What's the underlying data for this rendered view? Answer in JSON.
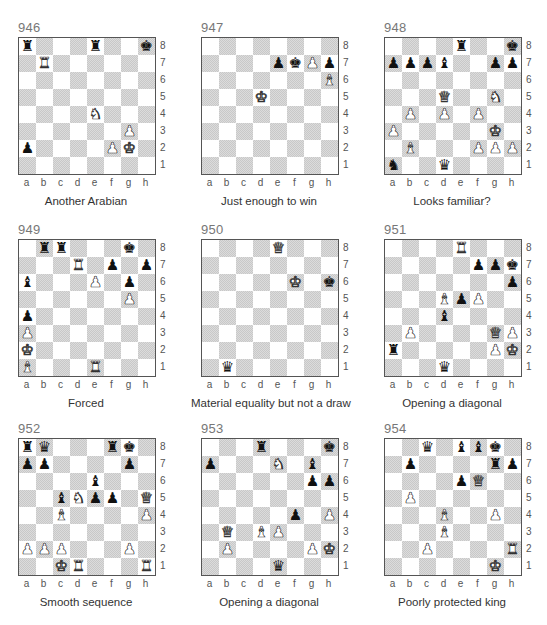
{
  "files": [
    "a",
    "b",
    "c",
    "d",
    "e",
    "f",
    "g",
    "h"
  ],
  "ranks": [
    "8",
    "7",
    "6",
    "5",
    "4",
    "3",
    "2",
    "1"
  ],
  "colors": {
    "dark_square": "#d0d0d0",
    "light_square": "#ffffff",
    "border": "#555555"
  },
  "puzzles": [
    {
      "number": "946",
      "caption": "Another Arabian",
      "pieces": [
        {
          "sq": "a8",
          "piece": "bR"
        },
        {
          "sq": "e8",
          "piece": "bR"
        },
        {
          "sq": "h8",
          "piece": "bK"
        },
        {
          "sq": "b7",
          "piece": "wR"
        },
        {
          "sq": "e4",
          "piece": "wN"
        },
        {
          "sq": "g3",
          "piece": "wP"
        },
        {
          "sq": "a2",
          "piece": "bP"
        },
        {
          "sq": "f2",
          "piece": "wP"
        },
        {
          "sq": "g2",
          "piece": "wK"
        }
      ]
    },
    {
      "number": "947",
      "caption": "Just enough to win",
      "pieces": [
        {
          "sq": "e7",
          "piece": "bP"
        },
        {
          "sq": "f7",
          "piece": "bK"
        },
        {
          "sq": "g7",
          "piece": "wP"
        },
        {
          "sq": "h7",
          "piece": "bP"
        },
        {
          "sq": "h6",
          "piece": "wB"
        },
        {
          "sq": "d5",
          "piece": "wK"
        }
      ]
    },
    {
      "number": "948",
      "caption": "Looks familiar?",
      "pieces": [
        {
          "sq": "e8",
          "piece": "bR"
        },
        {
          "sq": "h8",
          "piece": "bK"
        },
        {
          "sq": "a7",
          "piece": "bP"
        },
        {
          "sq": "b7",
          "piece": "bP"
        },
        {
          "sq": "c7",
          "piece": "bP"
        },
        {
          "sq": "d7",
          "piece": "bB"
        },
        {
          "sq": "g7",
          "piece": "bP"
        },
        {
          "sq": "h7",
          "piece": "bP"
        },
        {
          "sq": "d5",
          "piece": "wQ"
        },
        {
          "sq": "g5",
          "piece": "wN"
        },
        {
          "sq": "b4",
          "piece": "wP"
        },
        {
          "sq": "d4",
          "piece": "wP"
        },
        {
          "sq": "f4",
          "piece": "wP"
        },
        {
          "sq": "a3",
          "piece": "wP"
        },
        {
          "sq": "g3",
          "piece": "wK"
        },
        {
          "sq": "b2",
          "piece": "wB"
        },
        {
          "sq": "f2",
          "piece": "wP"
        },
        {
          "sq": "g2",
          "piece": "wP"
        },
        {
          "sq": "h2",
          "piece": "wP"
        },
        {
          "sq": "a1",
          "piece": "bN"
        },
        {
          "sq": "d1",
          "piece": "bQ"
        }
      ]
    },
    {
      "number": "949",
      "caption": "Forced",
      "pieces": [
        {
          "sq": "b8",
          "piece": "bR"
        },
        {
          "sq": "c8",
          "piece": "bR"
        },
        {
          "sq": "g8",
          "piece": "bK"
        },
        {
          "sq": "d7",
          "piece": "wR"
        },
        {
          "sq": "f7",
          "piece": "bP"
        },
        {
          "sq": "h7",
          "piece": "bP"
        },
        {
          "sq": "a6",
          "piece": "bB"
        },
        {
          "sq": "e6",
          "piece": "wP"
        },
        {
          "sq": "g6",
          "piece": "bP"
        },
        {
          "sq": "g5",
          "piece": "wP"
        },
        {
          "sq": "a4",
          "piece": "bP"
        },
        {
          "sq": "a3",
          "piece": "wP"
        },
        {
          "sq": "a2",
          "piece": "wK"
        },
        {
          "sq": "a1",
          "piece": "wB"
        },
        {
          "sq": "e1",
          "piece": "wR"
        }
      ]
    },
    {
      "number": "950",
      "caption": "Material equality but not a draw",
      "pieces": [
        {
          "sq": "e8",
          "piece": "wQ"
        },
        {
          "sq": "f6",
          "piece": "wK"
        },
        {
          "sq": "h6",
          "piece": "bK"
        },
        {
          "sq": "b1",
          "piece": "bQ"
        }
      ]
    },
    {
      "number": "951",
      "caption": "Opening a diagonal",
      "pieces": [
        {
          "sq": "e8",
          "piece": "wR"
        },
        {
          "sq": "f7",
          "piece": "bP"
        },
        {
          "sq": "g7",
          "piece": "bP"
        },
        {
          "sq": "h7",
          "piece": "bK"
        },
        {
          "sq": "h6",
          "piece": "bP"
        },
        {
          "sq": "d5",
          "piece": "wB"
        },
        {
          "sq": "e5",
          "piece": "bP"
        },
        {
          "sq": "f5",
          "piece": "wP"
        },
        {
          "sq": "d4",
          "piece": "bB"
        },
        {
          "sq": "b3",
          "piece": "wP"
        },
        {
          "sq": "g3",
          "piece": "wQ"
        },
        {
          "sq": "h3",
          "piece": "wP"
        },
        {
          "sq": "a2",
          "piece": "bR"
        },
        {
          "sq": "g2",
          "piece": "wP"
        },
        {
          "sq": "h2",
          "piece": "wK"
        },
        {
          "sq": "d1",
          "piece": "bQ"
        }
      ]
    },
    {
      "number": "952",
      "caption": "Smooth sequence",
      "pieces": [
        {
          "sq": "a8",
          "piece": "bR"
        },
        {
          "sq": "b8",
          "piece": "bQ"
        },
        {
          "sq": "f8",
          "piece": "bR"
        },
        {
          "sq": "g8",
          "piece": "bK"
        },
        {
          "sq": "a7",
          "piece": "bP"
        },
        {
          "sq": "b7",
          "piece": "bP"
        },
        {
          "sq": "g7",
          "piece": "bP"
        },
        {
          "sq": "e6",
          "piece": "bB"
        },
        {
          "sq": "c5",
          "piece": "bB"
        },
        {
          "sq": "d5",
          "piece": "wN"
        },
        {
          "sq": "e5",
          "piece": "bP"
        },
        {
          "sq": "f5",
          "piece": "bP"
        },
        {
          "sq": "h5",
          "piece": "wQ"
        },
        {
          "sq": "c4",
          "piece": "wB"
        },
        {
          "sq": "h4",
          "piece": "wP"
        },
        {
          "sq": "a2",
          "piece": "wP"
        },
        {
          "sq": "b2",
          "piece": "wP"
        },
        {
          "sq": "c2",
          "piece": "wP"
        },
        {
          "sq": "g2",
          "piece": "wP"
        },
        {
          "sq": "c1",
          "piece": "wK"
        },
        {
          "sq": "d1",
          "piece": "wR"
        },
        {
          "sq": "h1",
          "piece": "wR"
        }
      ]
    },
    {
      "number": "953",
      "caption": "Opening a diagonal",
      "pieces": [
        {
          "sq": "d8",
          "piece": "bR"
        },
        {
          "sq": "h8",
          "piece": "bK"
        },
        {
          "sq": "a7",
          "piece": "bP"
        },
        {
          "sq": "e7",
          "piece": "wN"
        },
        {
          "sq": "g7",
          "piece": "bB"
        },
        {
          "sq": "g6",
          "piece": "bP"
        },
        {
          "sq": "h6",
          "piece": "bP"
        },
        {
          "sq": "f4",
          "piece": "bP"
        },
        {
          "sq": "h4",
          "piece": "wP"
        },
        {
          "sq": "b3",
          "piece": "wQ"
        },
        {
          "sq": "d3",
          "piece": "wB"
        },
        {
          "sq": "e3",
          "piece": "wP"
        },
        {
          "sq": "b2",
          "piece": "wP"
        },
        {
          "sq": "g2",
          "piece": "wP"
        },
        {
          "sq": "h2",
          "piece": "wK"
        },
        {
          "sq": "e1",
          "piece": "bQ"
        }
      ]
    },
    {
      "number": "954",
      "caption": "Poorly protected king",
      "pieces": [
        {
          "sq": "c8",
          "piece": "bQ"
        },
        {
          "sq": "e8",
          "piece": "bB"
        },
        {
          "sq": "f8",
          "piece": "bB"
        },
        {
          "sq": "g8",
          "piece": "bK"
        },
        {
          "sq": "b7",
          "piece": "bP"
        },
        {
          "sq": "g7",
          "piece": "bR"
        },
        {
          "sq": "h7",
          "piece": "bP"
        },
        {
          "sq": "e6",
          "piece": "bP"
        },
        {
          "sq": "f6",
          "piece": "wQ"
        },
        {
          "sq": "b5",
          "piece": "wP"
        },
        {
          "sq": "d4",
          "piece": "wB"
        },
        {
          "sq": "g4",
          "piece": "wP"
        },
        {
          "sq": "d3",
          "piece": "wB"
        },
        {
          "sq": "c2",
          "piece": "wP"
        },
        {
          "sq": "h2",
          "piece": "wR"
        },
        {
          "sq": "g1",
          "piece": "wK"
        }
      ]
    }
  ]
}
